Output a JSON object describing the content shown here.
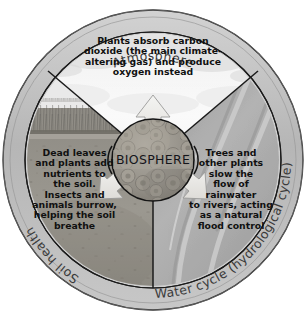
{
  "diagram": {
    "title_core": "BIOSPHERE",
    "rings": {
      "top_label": "Atmosphere",
      "left_label": "Soil health",
      "right_label": "Water cycle (hydrological cycle)"
    },
    "sectors": {
      "top": {
        "name": "atmosphere-sector",
        "lines": [
          "Plants absorb carbon",
          "dioxide (the main climate-",
          "altering gas) and produce",
          "oxygen instead"
        ],
        "text": "Plants absorb carbon dioxide (the main climate-altering gas) and produce oxygen instead"
      },
      "left": {
        "name": "soil-health-sector",
        "lines": [
          "Dead leaves",
          "and plants add",
          "nutrients to",
          "the soil.",
          "Insects and",
          "animals burrow,",
          "helping the soil",
          "breathe"
        ],
        "text": "Dead leaves and plants add nutrients to the soil. Insects and animals burrow, helping the soil breathe"
      },
      "right": {
        "name": "water-cycle-sector",
        "lines": [
          "Trees and",
          "other plants",
          "slow the",
          "flow of",
          "rainwater",
          "to rivers, acting",
          "as a natural",
          "flood control"
        ],
        "text": "Trees and other plants slow the flow of rainwater to rivers, acting as a natural flood control"
      }
    },
    "arrows": [
      {
        "name": "arrow-up",
        "direction": "up",
        "from": "biosphere",
        "to": "atmosphere"
      },
      {
        "name": "arrow-down-left",
        "direction": "down-left",
        "from": "biosphere",
        "to": "soil"
      },
      {
        "name": "arrow-down-right",
        "direction": "down-right",
        "from": "biosphere",
        "to": "water"
      }
    ],
    "colors": {
      "outline": "#1b1b1b",
      "ring_fill": "#b9b9b9",
      "sky_fill": "#f2f2f2",
      "soil_fill": "#8f8d88",
      "water_fill": "#a6a6a6",
      "core_fill": "#9a968f",
      "arrow_fill": "#e8e8e6",
      "page_background": "#ffffff",
      "text": "#101010",
      "ring_label_text": "#3a3a3a"
    }
  }
}
